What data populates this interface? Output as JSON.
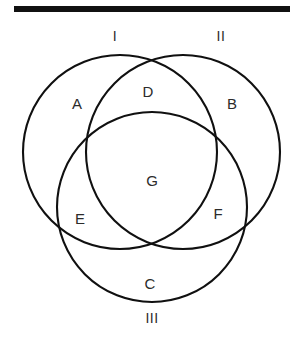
{
  "figure": {
    "background_color": "#ffffff",
    "stroke_color": "#101010",
    "text_color": "#2b2b2b",
    "rule_color": "#111111"
  },
  "sets": [
    {
      "label": "I",
      "x": 115,
      "y": 36
    },
    {
      "label": "II",
      "x": 221,
      "y": 36
    },
    {
      "label": "III",
      "x": 152,
      "y": 318
    }
  ],
  "regions": [
    {
      "label": "A",
      "x": 77,
      "y": 103
    },
    {
      "label": "D",
      "x": 148,
      "y": 91
    },
    {
      "label": "B",
      "x": 232,
      "y": 103
    },
    {
      "label": "G",
      "x": 152,
      "y": 180
    },
    {
      "label": "E",
      "x": 80,
      "y": 218
    },
    {
      "label": "F",
      "x": 218,
      "y": 213
    },
    {
      "label": "C",
      "x": 150,
      "y": 283
    }
  ],
  "circles": [
    {
      "name": "circle-i",
      "cx": 120,
      "cy": 152,
      "r": 97
    },
    {
      "name": "circle-ii",
      "cx": 183,
      "cy": 152,
      "r": 97
    },
    {
      "name": "circle-iii",
      "cx": 152,
      "cy": 207,
      "r": 95
    }
  ]
}
